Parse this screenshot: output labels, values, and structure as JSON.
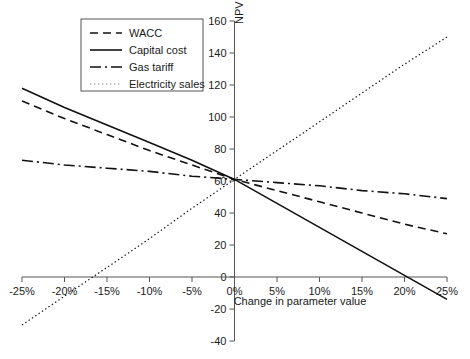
{
  "chart_data": {
    "type": "line",
    "title": "",
    "xlabel": "Change in parameter value",
    "ylabel": "NPV (€m)",
    "xlim": [
      -25,
      25
    ],
    "ylim": [
      -40,
      160
    ],
    "grid": false,
    "legend_position": "top-left",
    "x_ticks": [
      "-25%",
      "-20%",
      "-15%",
      "-10%",
      "-5%",
      "0%",
      "5%",
      "10%",
      "15%",
      "20%",
      "25%"
    ],
    "x_tick_values": [
      -25,
      -20,
      -15,
      -10,
      -5,
      0,
      5,
      10,
      15,
      20,
      25
    ],
    "y_ticks": [
      "-40",
      "-20",
      "0",
      "20",
      "40",
      "60",
      "80",
      "100",
      "120",
      "140",
      "160"
    ],
    "y_tick_values": [
      -40,
      -20,
      0,
      20,
      40,
      60,
      80,
      100,
      120,
      140,
      160
    ],
    "x": [
      -25,
      -20,
      -15,
      -10,
      -5,
      0,
      5,
      10,
      15,
      20,
      25
    ],
    "series": [
      {
        "name": "WACC",
        "style": "dashed",
        "dash": "8,5",
        "width": 1.6,
        "color": "#111111",
        "values": [
          110,
          99,
          89,
          79,
          70,
          61,
          54,
          47,
          40,
          33,
          27
        ]
      },
      {
        "name": "Capital cost",
        "style": "solid",
        "dash": "none",
        "width": 1.6,
        "color": "#111111",
        "values": [
          118,
          106,
          95,
          84,
          73,
          61,
          46,
          31,
          16,
          1,
          -14
        ]
      },
      {
        "name": "Gas tariff",
        "style": "dash-dot",
        "dash": "11,4,2,4",
        "width": 1.6,
        "color": "#111111",
        "values": [
          73,
          70,
          68,
          66,
          63,
          61,
          59,
          57,
          54,
          52,
          49
        ]
      },
      {
        "name": "Electricity sales",
        "style": "dotted",
        "dash": "1.4,2.6",
        "width": 1.2,
        "color": "#8a8a8a",
        "values": [
          -30,
          -12,
          6,
          24,
          43,
          61,
          79,
          97,
          115,
          133,
          150
        ]
      }
    ]
  },
  "legend": {
    "entries": [
      {
        "label": "WACC"
      },
      {
        "label": "Capital cost"
      },
      {
        "label": "Gas tariff"
      },
      {
        "label": "Electricity sales"
      }
    ]
  }
}
